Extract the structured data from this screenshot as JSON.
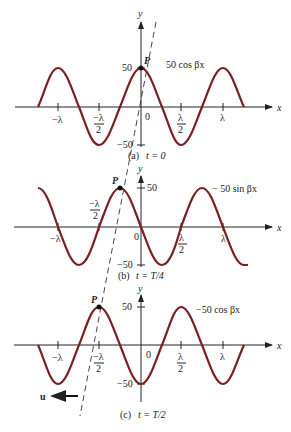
{
  "figure": {
    "axis_labels": {
      "x": "x",
      "y": "y"
    },
    "tick_labels": {
      "neg_lambda": "−λ",
      "neg_half_lambda_num": "−λ",
      "half_den": "2",
      "half_lambda_num": "λ",
      "lambda": "λ",
      "zero": "0",
      "y_pos": "50",
      "y_neg": "−50"
    },
    "point_label": "P",
    "velocity_label": "u",
    "panels": [
      {
        "id": "a",
        "caption_letter": "(a)",
        "caption_time": "t = 0",
        "curve_label": "50 cos βx",
        "function": "50 cos(βx)"
      },
      {
        "id": "b",
        "caption_letter": "(b)",
        "caption_time": "t = T/4",
        "curve_label": "− 50 sin βx",
        "function": "-50 sin(βx)"
      },
      {
        "id": "c",
        "caption_letter": "(c)",
        "caption_time": "t = T/2",
        "curve_label": "−50 cos βx",
        "function": "-50 cos(βx)"
      }
    ],
    "colors": {
      "wave": "#7a1f22",
      "axis": "#222222"
    }
  }
}
